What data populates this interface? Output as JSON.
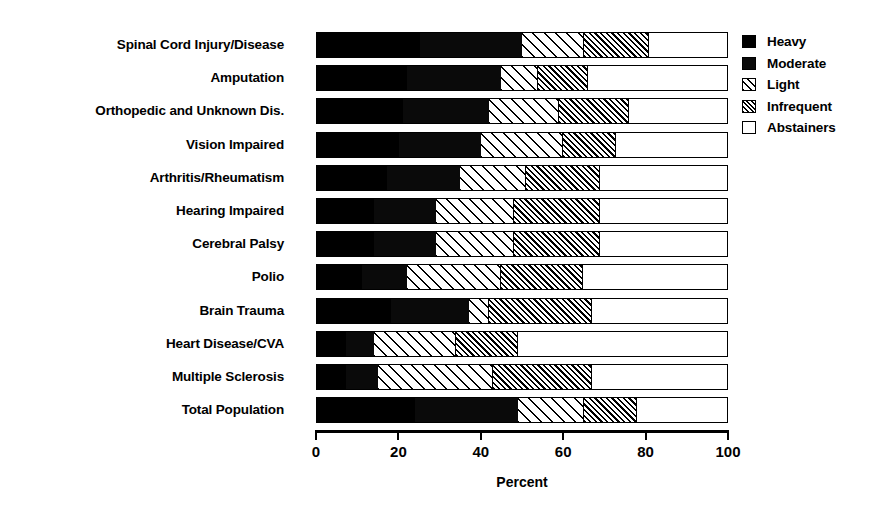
{
  "chart_data": {
    "type": "bar",
    "orientation": "horizontal",
    "stacked": true,
    "stack_total": 100,
    "title": "",
    "subtitle": "",
    "xlabel": "Percent",
    "ylabel": "",
    "xlim": [
      0,
      100
    ],
    "xticks": [
      0,
      20,
      40,
      60,
      80,
      100
    ],
    "xtick_labels": [
      "0",
      "20",
      "40",
      "60",
      "80",
      "100"
    ],
    "grid": false,
    "legend_position": "right",
    "categories": [
      "Spinal Cord Injury/Disease",
      "Amputation",
      "Orthopedic and Unknown Dis.",
      "Vision Impaired",
      "Arthritis/Rheumatism",
      "Hearing Impaired",
      "Cerebral Palsy",
      "Polio",
      "Brain Trauma",
      "Heart Disease/CVA",
      "Multiple Sclerosis",
      "Total Population"
    ],
    "series": [
      {
        "name": "Heavy",
        "pattern": "solid-black",
        "color": "#000000",
        "values": [
          25,
          22,
          21,
          20,
          17,
          14,
          14,
          11,
          18,
          7,
          7,
          24
        ]
      },
      {
        "name": "Moderate",
        "pattern": "solid-black",
        "color": "#0a0a0a",
        "values": [
          25,
          23,
          21,
          20,
          18,
          15,
          15,
          11,
          19,
          7,
          8,
          25
        ]
      },
      {
        "name": "Light",
        "pattern": "sparse-diagonal-hatch",
        "color": "#ffffff",
        "values": [
          15,
          9,
          17,
          20,
          16,
          19,
          19,
          23,
          5,
          20,
          28,
          16
        ]
      },
      {
        "name": "Infrequent",
        "pattern": "dense-diagonal-hatch",
        "color": "#ffffff",
        "values": [
          16,
          12,
          17,
          13,
          18,
          21,
          21,
          20,
          25,
          15,
          24,
          13
        ]
      },
      {
        "name": "Abstainers",
        "pattern": "white-open",
        "color": "#ffffff",
        "values": [
          19,
          34,
          24,
          27,
          31,
          31,
          31,
          35,
          33,
          51,
          33,
          22
        ]
      }
    ],
    "cumulative_boundaries": {
      "note": "Read off axis: end of black (Heavy+Moderate), end of Light, end of Infrequent",
      "Spinal Cord Injury/Disease": [
        50,
        65,
        81
      ],
      "Amputation": [
        45,
        54,
        66
      ],
      "Orthopedic and Unknown Dis.": [
        42,
        59,
        76
      ],
      "Vision Impaired": [
        40,
        60,
        73
      ],
      "Arthritis/Rheumatism": [
        35,
        51,
        69
      ],
      "Hearing Impaired": [
        29,
        48,
        69
      ],
      "Cerebral Palsy": [
        29,
        48,
        69
      ],
      "Polio": [
        22,
        45,
        65
      ],
      "Brain Trauma": [
        37,
        42,
        67
      ],
      "Heart Disease/CVA": [
        14,
        34,
        49
      ],
      "Multiple Sclerosis": [
        15,
        43,
        67
      ],
      "Total Population": [
        49,
        65,
        78
      ]
    }
  },
  "axis": {
    "x_title": "Percent"
  },
  "legend": {
    "items": [
      {
        "label": "Heavy",
        "swatch": "solid-black-swatch"
      },
      {
        "label": "Moderate",
        "swatch": "solid-black-swatch"
      },
      {
        "label": "Light",
        "swatch": "sparse-hatch-swatch"
      },
      {
        "label": "Infrequent",
        "swatch": "dense-hatch-swatch"
      },
      {
        "label": "Abstainers",
        "swatch": "open-white-swatch"
      }
    ]
  }
}
